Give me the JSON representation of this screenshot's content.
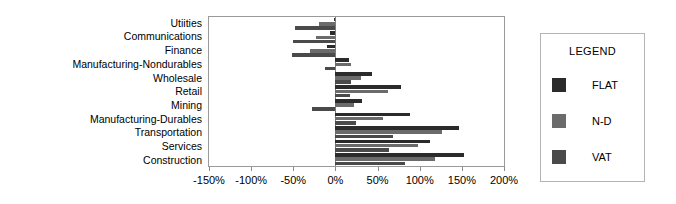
{
  "chart_data": {
    "type": "bar",
    "orientation": "horizontal",
    "title": "",
    "xlabel": "",
    "ylabel": "",
    "xlim": [
      -150,
      200
    ],
    "xticks": [
      -150,
      -100,
      -50,
      0,
      50,
      100,
      150,
      200
    ],
    "xtick_labels": [
      "-150%",
      "-100%",
      "-50%",
      "0%",
      "50%",
      "100%",
      "150%",
      "200%"
    ],
    "grid": false,
    "legend_position": "right-outside",
    "categories": [
      "Utiities",
      "Communications",
      "Finance",
      "Manufacturing-Nondurables",
      "Wholesale",
      "Retail",
      "Mining",
      "Manufacturing-Durables",
      "Transportation",
      "Services",
      "Construction"
    ],
    "series": [
      {
        "name": "FLAT",
        "color": "#2b2b2b",
        "values": [
          -2,
          -6,
          -10,
          16,
          43,
          78,
          32,
          88,
          147,
          112,
          153
        ]
      },
      {
        "name": "N-D",
        "color": "#6b6b6b",
        "values": [
          -20,
          -23,
          -30,
          18,
          30,
          62,
          22,
          57,
          126,
          98,
          118
        ]
      },
      {
        "name": "VAT",
        "color": "#4a4a4a",
        "values": [
          -48,
          -50,
          -52,
          -12,
          18,
          17,
          -28,
          24,
          68,
          63,
          82
        ]
      }
    ]
  },
  "legend": {
    "title": "LEGEND",
    "entries": [
      {
        "label": "FLAT",
        "color": "#2b2b2b"
      },
      {
        "label": "N-D",
        "color": "#6b6b6b"
      },
      {
        "label": "VAT",
        "color": "#4a4a4a"
      }
    ]
  }
}
